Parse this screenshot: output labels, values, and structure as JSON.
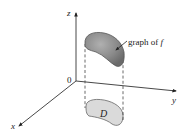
{
  "diagram": {
    "type": "3d-surface-over-region",
    "axes": {
      "x_label": "x",
      "y_label": "y",
      "z_label": "z",
      "origin_label": "0"
    },
    "surface": {
      "label": "graph of f",
      "label_text": "graph of ",
      "label_func": "f",
      "fill_dark": "#7a7a7a",
      "fill_light": "#b8b8b8"
    },
    "region": {
      "label": "D",
      "fill": "#d9d9d9"
    },
    "colors": {
      "axis": "#333333",
      "dashed": "#444444",
      "outline": "#555555"
    }
  }
}
